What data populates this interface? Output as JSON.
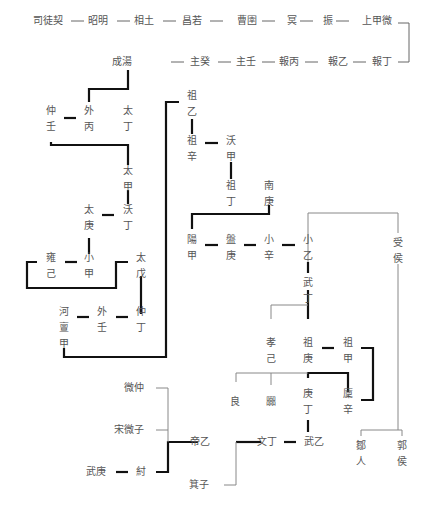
{
  "diagram": {
    "title": "",
    "row1": [
      "司徒契",
      "昭明",
      "相土",
      "昌若",
      "曹圉",
      "冥",
      "振",
      "上甲微"
    ],
    "row2": [
      "成湯",
      "主癸",
      "主壬",
      "報丙",
      "報乙",
      "報丁"
    ],
    "nodes": {
      "zhongren": "仲壬",
      "waibing": "外丙",
      "taiding": "太丁",
      "taijia": "太甲",
      "woding": "沃丁",
      "taigeng": "太庚",
      "yongji": "雍己",
      "xiaojia": "小甲",
      "taiwu": "太戊",
      "hedanjia": "河亶甲",
      "wairen": "外壬",
      "zhongding": "仲丁",
      "zuyi": "祖乙",
      "zuxin": "祖辛",
      "wojia": "沃甲",
      "zuding": "祖丁",
      "nangeng": "南庚",
      "yangjia": "陽甲",
      "pangeng": "盤庚",
      "xiaoxin": "小辛",
      "xiaoyi": "小乙",
      "wuding": "武丁",
      "shouhou": "受侯",
      "xiaoji": "孝己",
      "zugeng": "祖庚",
      "zujia": "祖甲",
      "liang": "良",
      "nie": "嚻",
      "gengding": "庚丁",
      "linxin": "廩辛",
      "weizhong": "微仲",
      "songweizi": "宋微子",
      "diyi": "帝乙",
      "wending": "文丁",
      "wuyi": "武乙",
      "wugeng": "武庚",
      "zhou": "紂",
      "jizi": "箕子",
      "muren": "鄒人",
      "guohou": "郭侯"
    },
    "connector": "—",
    "colors": {
      "thick_line": "#111111",
      "thin_line": "#888888",
      "text": "#555555"
    }
  }
}
